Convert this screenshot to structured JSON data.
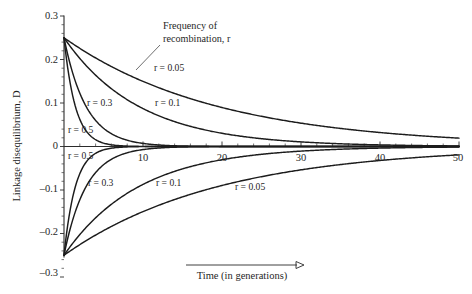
{
  "chart_data": {
    "type": "line",
    "title": "",
    "xlabel": "Time (in generations)",
    "ylabel": "Linkage disequilibrium, D",
    "xlim": [
      0,
      50
    ],
    "ylim": [
      -0.3,
      0.3
    ],
    "grid": false,
    "legend_position": "inline-labels",
    "annotation": "Frequency of recombination, r",
    "xticks": [
      0,
      10,
      20,
      30,
      40,
      50
    ],
    "xtick_labels": [
      "",
      "10",
      "20",
      "30",
      "40",
      "50"
    ],
    "xtick_minor_step": 2,
    "yticks": [
      -0.3,
      -0.2,
      -0.1,
      0,
      0.1,
      0.2,
      0.3
    ],
    "ytick_labels": [
      "-0.3",
      "-0.2",
      "-0.1",
      "0",
      "0.1",
      "0.2",
      "0.3"
    ],
    "model": "D(t) = D0 * (1 - r)^t",
    "series": [
      {
        "name": "r = 0.05 (positive)",
        "r": 0.05,
        "D0": 0.25,
        "label": "r = 0.05",
        "values": [
          0.25,
          0.1945,
          0.1513,
          0.1177,
          0.0916,
          0.0712,
          0.0554,
          0.0431,
          0.0335,
          0.0261,
          0.0203
        ]
      },
      {
        "name": "r = 0.1 (positive)",
        "r": 0.1,
        "D0": 0.25,
        "label": "r = 0.1",
        "values": [
          0.25,
          0.1494,
          0.0893,
          0.0533,
          0.0319,
          0.0191,
          0.0114,
          0.0068,
          0.0041,
          0.0024,
          0.0015
        ]
      },
      {
        "name": "r = 0.3 (positive)",
        "r": 0.3,
        "D0": 0.25,
        "label": "r = 0.3",
        "values": [
          0.25,
          0.0706,
          0.0199,
          0.0056,
          0.0016,
          0.0004,
          0.0001,
          0.0,
          0.0,
          0.0,
          0.0
        ]
      },
      {
        "name": "r = 0.5 (positive)",
        "r": 0.5,
        "D0": 0.25,
        "label": "r = 0.5",
        "values": [
          0.25,
          0.0244,
          0.0024,
          0.0002,
          0.0,
          0.0,
          0.0,
          0.0,
          0.0,
          0.0,
          0.0
        ]
      },
      {
        "name": "r = 0.05 (negative)",
        "r": 0.05,
        "D0": -0.25,
        "label": "r = 0.05",
        "values": [
          -0.25,
          -0.1945,
          -0.1513,
          -0.1177,
          -0.0916,
          -0.0712,
          -0.0554,
          -0.0431,
          -0.0335,
          -0.0261,
          -0.0203
        ]
      },
      {
        "name": "r = 0.1 (negative)",
        "r": 0.1,
        "D0": -0.25,
        "label": "r = 0.1",
        "values": [
          -0.25,
          -0.1494,
          -0.0893,
          -0.0533,
          -0.0319,
          -0.0191,
          -0.0114,
          -0.0068,
          -0.0041,
          -0.0024,
          -0.0015
        ]
      },
      {
        "name": "r = 0.3 (negative)",
        "r": 0.3,
        "D0": -0.25,
        "label": "r = 0.3",
        "values": [
          -0.25,
          -0.0706,
          -0.0199,
          -0.0056,
          -0.0016,
          -0.0004,
          -0.0001,
          0.0,
          0.0,
          0.0,
          0.0
        ]
      },
      {
        "name": "r = 0.5 (negative)",
        "r": 0.5,
        "D0": -0.25,
        "label": "r = 0.5",
        "values": [
          -0.25,
          -0.0244,
          -0.0024,
          -0.0002,
          0.0,
          0.0,
          0.0,
          0.0,
          0.0,
          0.0,
          0.0
        ]
      }
    ],
    "x": [
      0,
      5,
      10,
      15,
      20,
      25,
      30,
      35,
      40,
      45,
      50
    ]
  },
  "labels": {
    "y_axis_title": "Linkage disequilibrium, D",
    "x_axis_title": "Time (in generations)",
    "annotation_line1": "Frequency of",
    "annotation_line2": "recombination, r",
    "ytick_0_3": "0.3",
    "ytick_0_2": "0.2",
    "ytick_0_1": "0.1",
    "ytick_0": "0",
    "ytick_n0_1": "–0.1",
    "ytick_n0_2": "–0.2",
    "ytick_n0_3": "–0.3",
    "xtick_10": "10",
    "xtick_20": "20",
    "xtick_30": "30",
    "xtick_40": "40",
    "xtick_50": "50",
    "curve_label_r005_top": "r = 0.05",
    "curve_label_r01_top": "r = 0.1",
    "curve_label_r03_top": "r = 0.3",
    "curve_label_r05_top": "r = 0.5",
    "curve_label_r05_bottom": "r = 0.5",
    "curve_label_r03_bottom": "r = 0.3",
    "curve_label_r01_bottom": "r = 0.1",
    "curve_label_r005_bottom": "r = 0.05"
  },
  "colors": {
    "curve": "#1c1c1c",
    "axis": "#2b2b2b",
    "text": "#1f1f1f",
    "background": "#ffffff"
  }
}
